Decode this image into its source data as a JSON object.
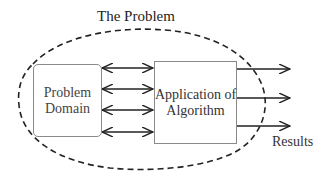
{
  "title": "The Problem",
  "nodes": {
    "problem_domain": {
      "label_line1": "Problem",
      "label_line2": "Domain"
    },
    "algorithm": {
      "label_line1": "Application of",
      "label_line2": "Algorithm"
    }
  },
  "outputs_label": "Results",
  "connections": {
    "bidirectional_count": 4,
    "output_arrow_count": 3
  },
  "colors": {
    "stroke": "#222222",
    "box_border": "#8a8a8a",
    "text": "#222222"
  }
}
